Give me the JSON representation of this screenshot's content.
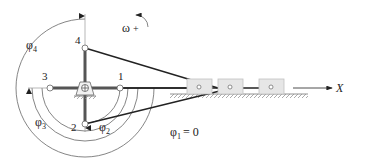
{
  "diagram": {
    "type": "slider-crank mechanism",
    "crank_positions": [
      {
        "id": "1",
        "label": "1",
        "angle_symbol": "φ1",
        "angle_note": "= 0"
      },
      {
        "id": "2",
        "label": "2",
        "angle_symbol": "φ2"
      },
      {
        "id": "3",
        "label": "3",
        "angle_symbol": "φ3"
      },
      {
        "id": "4",
        "label": "4",
        "angle_symbol": "φ4"
      }
    ],
    "labels": {
      "pos1": "1",
      "pos2": "2",
      "pos3": "3",
      "pos4": "4",
      "phi4": "φ",
      "phi4_sub": "4",
      "phi3": "φ",
      "phi3_sub": "3",
      "phi2": "φ",
      "phi2_sub": "2",
      "phi2_sign": "-",
      "phi1": "φ",
      "phi1_sub": "1",
      "phi1_eq": "= 0",
      "omega": "ω",
      "omega_sign": "+",
      "x_axis": "X"
    },
    "colors": {
      "link": "#222222",
      "crank": "#555555",
      "slider_fill": "#e6e6e6",
      "slider_stroke": "#bdbdbd",
      "arc": "#555555",
      "ground": "#777777"
    }
  }
}
